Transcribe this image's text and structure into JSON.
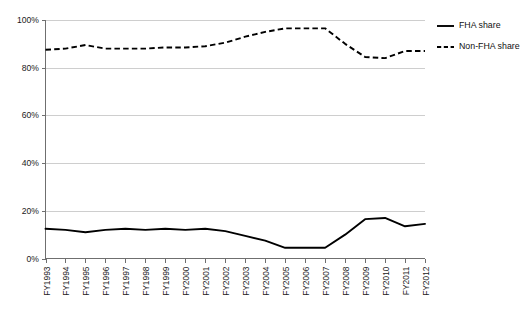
{
  "chart_data": {
    "type": "line",
    "title": "",
    "subtitle": "",
    "xlabel": "",
    "ylabel": "",
    "categories": [
      "FY1993",
      "FY1994",
      "FY1995",
      "FY1996",
      "FY1997",
      "FY1998",
      "FY1999",
      "FY2000",
      "FY2001",
      "FY2002",
      "FY2003",
      "FY2004",
      "FY2005",
      "FY2006",
      "FY2007",
      "FY2008",
      "FY2009",
      "FY2010",
      "FY2011",
      "FY2012"
    ],
    "series": [
      {
        "name": "FHA share",
        "style": "solid",
        "color": "#000000",
        "values": [
          12.5,
          12.0,
          11.0,
          12.0,
          12.5,
          12.0,
          12.5,
          12.0,
          12.5,
          11.5,
          9.5,
          7.5,
          4.5,
          4.5,
          4.5,
          10.0,
          16.5,
          17.0,
          13.5,
          14.5
        ]
      },
      {
        "name": "Non-FHA share",
        "style": "dashed",
        "color": "#000000",
        "values": [
          87.5,
          88.0,
          89.5,
          88.0,
          88.0,
          88.0,
          88.5,
          88.5,
          89.0,
          90.5,
          93.0,
          95.0,
          96.5,
          96.5,
          96.5,
          90.0,
          84.5,
          84.0,
          87.0,
          87.0
        ]
      }
    ],
    "ylim": [
      0,
      100
    ],
    "yticks": [
      0,
      20,
      40,
      60,
      80,
      100
    ],
    "ytick_labels": [
      "0%",
      "20%",
      "40%",
      "60%",
      "80%",
      "100%"
    ],
    "grid": true,
    "grid_axis": "y",
    "legend_position": "right-top",
    "xtick_label_rotation": -90
  },
  "legend": {
    "entries": [
      {
        "label": "FHA share"
      },
      {
        "label": "Non-FHA share"
      }
    ]
  }
}
